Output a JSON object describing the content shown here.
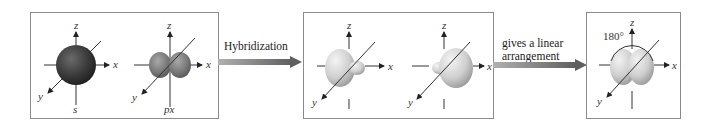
{
  "diagram": {
    "panels": [
      {
        "id": "atomic-orbitals",
        "orbitals": [
          {
            "label": "s",
            "axes": {
              "x": "x",
              "y": "y",
              "z": "z"
            }
          },
          {
            "label": "px",
            "axes": {
              "x": "x",
              "y": "y",
              "z": "z"
            }
          }
        ]
      },
      {
        "id": "sp-hybrid-orbitals",
        "orbitals": [
          {
            "label": "",
            "axes": {
              "x": "x",
              "y": "y",
              "z": "z"
            }
          },
          {
            "label": "",
            "axes": {
              "x": "x",
              "y": "y",
              "z": "z"
            }
          }
        ]
      },
      {
        "id": "linear-arrangement",
        "angle_label": "180°",
        "axes": {
          "x": "x",
          "y": "y",
          "z": "z"
        }
      }
    ],
    "arrows": [
      {
        "label": "Hybridization"
      },
      {
        "label_line1": "gives a linear",
        "label_line2": "arrangement"
      }
    ],
    "colors": {
      "s_orbital": "#3a3a3a",
      "p_orbital": "#7a7a7a",
      "hybrid_orbital": "#d8d8d8",
      "arrow": "#6e6e6e",
      "panel_border": "#8a8a8a"
    }
  }
}
